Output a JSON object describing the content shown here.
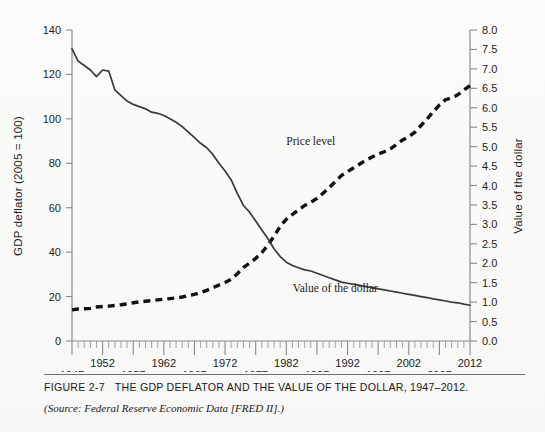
{
  "figure": {
    "caption_number": "FIGURE 2-7",
    "caption_title": "THE GDP DEFLATOR AND THE VALUE OF THE DOLLAR, 1947–2012.",
    "source_note": "(Source: Federal Reserve Economic Data [FRED II].)"
  },
  "chart_data": {
    "type": "line",
    "title": "",
    "xlabel": "",
    "ylabel": "GDP deflator (2005 = 100)",
    "y2label": "Value of the dollar",
    "xlim": [
      1947,
      2012
    ],
    "ylim": [
      0,
      140
    ],
    "y2lim": [
      0.0,
      8.0
    ],
    "grid": false,
    "legend": "annotations-inline",
    "x_ticks_labeled": [
      1947,
      1952,
      1957,
      1962,
      1967,
      1972,
      1977,
      1982,
      1987,
      1992,
      1997,
      2002,
      2007,
      2012
    ],
    "x_tick_rows": {
      "upper": [
        1952,
        1962,
        1972,
        1982,
        1992,
        2002,
        2012
      ],
      "lower": [
        1947,
        1957,
        1967,
        1977,
        1987,
        1997,
        2007
      ]
    },
    "x_minor_tick_interval": 1,
    "y_ticks": [
      0,
      20,
      40,
      60,
      80,
      100,
      120,
      140
    ],
    "y2_ticks": [
      0.0,
      0.5,
      1.0,
      1.5,
      2.0,
      2.5,
      3.0,
      3.5,
      4.0,
      4.5,
      5.0,
      5.5,
      6.0,
      6.5,
      7.0,
      7.5,
      8.0
    ],
    "annotations": [
      {
        "text": "Price level",
        "x": 1986,
        "y_axis": "right",
        "y": 5.05
      },
      {
        "text": "Value of the dollar",
        "x": 1990,
        "y_axis": "left",
        "y": 22
      }
    ],
    "series": [
      {
        "name": "Value of the dollar",
        "style": "solid",
        "color": "#3a3a3a",
        "axis": "left",
        "note": "plotted on left GDP-deflator scale; equals 100/price-index scaled",
        "x": [
          1947,
          1948,
          1949,
          1950,
          1951,
          1952,
          1953,
          1954,
          1955,
          1956,
          1957,
          1958,
          1959,
          1960,
          1961,
          1962,
          1963,
          1964,
          1965,
          1966,
          1967,
          1968,
          1969,
          1970,
          1971,
          1972,
          1973,
          1974,
          1975,
          1976,
          1977,
          1978,
          1979,
          1980,
          1981,
          1982,
          1983,
          1984,
          1985,
          1986,
          1987,
          1988,
          1989,
          1990,
          1991,
          1992,
          1993,
          1994,
          1995,
          1996,
          1997,
          1998,
          1999,
          2000,
          2001,
          2002,
          2003,
          2004,
          2005,
          2006,
          2007,
          2008,
          2009,
          2010,
          2011,
          2012
        ],
        "values": [
          131.5,
          126.0,
          124.0,
          122.0,
          119.0,
          122.0,
          121.5,
          113.0,
          110.5,
          108.0,
          106.5,
          105.5,
          104.5,
          103.0,
          102.5,
          101.5,
          100.0,
          98.5,
          96.5,
          94.0,
          91.5,
          89.0,
          87.0,
          84.0,
          80.0,
          76.5,
          72.5,
          66.5,
          61.0,
          58.0,
          54.0,
          50.0,
          46.0,
          41.5,
          38.0,
          35.5,
          34.0,
          33.0,
          32.0,
          31.5,
          30.5,
          29.5,
          28.5,
          27.5,
          26.5,
          26.0,
          25.5,
          25.0,
          24.5,
          24.0,
          23.5,
          23.0,
          22.5,
          22.0,
          21.5,
          21.0,
          20.5,
          20.0,
          19.5,
          19.0,
          18.5,
          18.0,
          17.5,
          17.2,
          16.6,
          16.1
        ]
      },
      {
        "name": "Price level",
        "style": "dashed",
        "color": "#111111",
        "axis": "left",
        "note": "GDP deflator, 2005 = 100, rescaled for display against right dollar axis",
        "x": [
          1947,
          1948,
          1949,
          1950,
          1951,
          1952,
          1953,
          1954,
          1955,
          1956,
          1957,
          1958,
          1959,
          1960,
          1961,
          1962,
          1963,
          1964,
          1965,
          1966,
          1967,
          1968,
          1969,
          1970,
          1971,
          1972,
          1973,
          1974,
          1975,
          1976,
          1977,
          1978,
          1979,
          1980,
          1981,
          1982,
          1983,
          1984,
          1985,
          1986,
          1987,
          1988,
          1989,
          1990,
          1991,
          1992,
          1993,
          1994,
          1995,
          1996,
          1997,
          1998,
          1999,
          2000,
          2001,
          2002,
          2003,
          2004,
          2005,
          2006,
          2007,
          2008,
          2009,
          2010,
          2011,
          2012
        ],
        "values": [
          14.0,
          14.4,
          14.5,
          14.7,
          15.3,
          15.5,
          15.7,
          16.0,
          16.3,
          16.7,
          17.2,
          17.6,
          17.9,
          18.2,
          18.5,
          18.8,
          19.1,
          19.4,
          19.8,
          20.4,
          21.0,
          21.8,
          22.8,
          24.0,
          25.2,
          26.3,
          27.8,
          30.3,
          33.1,
          35.0,
          37.2,
          39.8,
          43.2,
          47.2,
          51.6,
          54.8,
          57.0,
          59.0,
          61.0,
          62.4,
          64.2,
          66.5,
          69.0,
          71.8,
          74.5,
          76.2,
          78.0,
          79.7,
          81.4,
          82.8,
          84.2,
          85.2,
          86.5,
          88.5,
          90.5,
          92.0,
          94.0,
          97.0,
          100.0,
          103.2,
          106.2,
          108.6,
          109.5,
          110.8,
          113.0,
          115.0
        ]
      }
    ]
  }
}
